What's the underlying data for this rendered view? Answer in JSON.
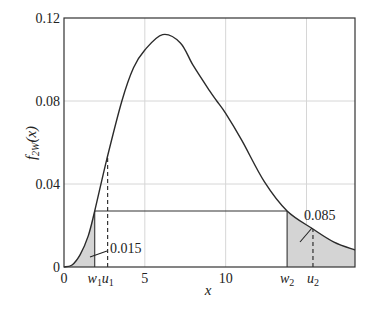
{
  "chart_data": {
    "type": "line",
    "title": "",
    "xlabel": "x",
    "ylabel": "f2W(x)",
    "ylabel_parts": {
      "base": "f",
      "sub": "2W",
      "arg": "(x)"
    },
    "xlim": [
      0,
      18
    ],
    "ylim": [
      0,
      0.12
    ],
    "grid": true,
    "x_ticks": [
      {
        "value": 0,
        "label": "0"
      },
      {
        "value": 1.9,
        "label": "w",
        "sub": "1"
      },
      {
        "value": 2.7,
        "label": "u",
        "sub": "1"
      },
      {
        "value": 5,
        "label": "5"
      },
      {
        "value": 10,
        "label": "10"
      },
      {
        "value": 13.8,
        "label": "w",
        "sub": "2"
      },
      {
        "value": 15.4,
        "label": "u",
        "sub": "2"
      }
    ],
    "x_gridlines": [
      5,
      10,
      15
    ],
    "y_ticks": [
      {
        "value": 0,
        "label": "0"
      },
      {
        "value": 0.04,
        "label": "0.04"
      },
      {
        "value": 0.08,
        "label": "0.08"
      },
      {
        "value": 0.12,
        "label": "0.12"
      }
    ],
    "series": [
      {
        "name": "f2W(x)",
        "x": [
          0,
          0.5,
          1,
          1.5,
          1.9,
          2.65,
          3.58,
          4.3,
          5,
          6.1,
          7.2,
          8,
          9,
          9.45,
          10,
          11,
          12.4,
          13.8,
          15.4,
          16.7,
          18
        ],
        "values": [
          0,
          0.001,
          0.006,
          0.015,
          0.027,
          0.052,
          0.08,
          0.096,
          0.1046,
          0.112,
          0.108,
          0.097,
          0.085,
          0.08,
          0.074,
          0.061,
          0.041,
          0.027,
          0.0183,
          0.012,
          0.0082
        ]
      }
    ],
    "shaded_regions": [
      {
        "from": 0,
        "to": 1.9,
        "area": 0.015
      },
      {
        "from": 13.8,
        "to": 18,
        "area": 0.085
      }
    ],
    "horizontal_segment": {
      "from": 1.9,
      "to": 13.8,
      "y": 0.027
    },
    "dashed_lines": [
      {
        "x": 2.7,
        "label": "u1"
      },
      {
        "x": 15.4,
        "label": "u2"
      }
    ],
    "annotations": [
      {
        "text": "0.015",
        "target": "left shaded area"
      },
      {
        "text": "0.085",
        "target": "right shaded area"
      }
    ]
  }
}
